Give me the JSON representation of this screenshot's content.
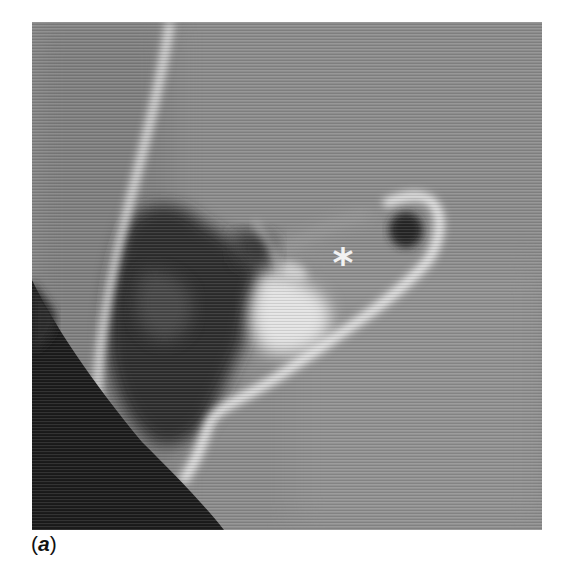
{
  "figure": {
    "panel_label_open": "(",
    "panel_label_letter": "a",
    "panel_label_close": ")",
    "marker_symbol": "*",
    "colors": {
      "background_tissue": "#8a8a8a",
      "bone": "#f0f0f0",
      "air": "#1c1c1c",
      "page": "#ffffff"
    },
    "marker_position": {
      "x": 343,
      "y": 260
    }
  }
}
